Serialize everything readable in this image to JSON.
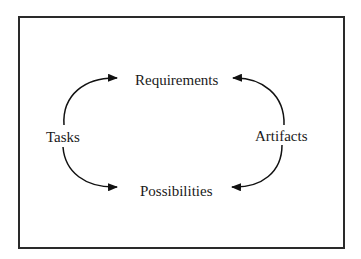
{
  "diagram": {
    "nodes": {
      "requirements": "Requirements",
      "possibilities": "Possibilities",
      "tasks": "Tasks",
      "artifacts": "Artifacts"
    },
    "edges": [
      {
        "from": "Tasks",
        "to": "Requirements"
      },
      {
        "from": "Tasks",
        "to": "Possibilities"
      },
      {
        "from": "Artifacts",
        "to": "Requirements"
      },
      {
        "from": "Artifacts",
        "to": "Possibilities"
      }
    ],
    "colors": {
      "stroke": "#1a1a1a",
      "background": "#ffffff"
    }
  }
}
